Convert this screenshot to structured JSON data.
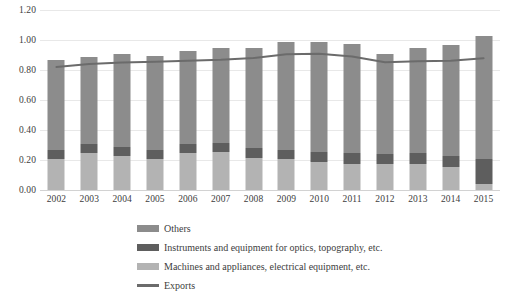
{
  "chart_data": {
    "type": "bar",
    "subtype": "stacked-bar-with-line",
    "title": "",
    "xlabel": "",
    "ylabel": "",
    "ylim": [
      0.0,
      1.2
    ],
    "ytick_labels": [
      "1.20",
      "1.00",
      "0.80",
      "0.60",
      "0.40",
      "0.20",
      "0.00"
    ],
    "ytick_values": [
      1.2,
      1.0,
      0.8,
      0.6,
      0.4,
      0.2,
      0.0
    ],
    "grid": true,
    "legend_position": "bottom-left",
    "categories": [
      "2002",
      "2003",
      "2004",
      "2005",
      "2006",
      "2007",
      "2008",
      "2009",
      "2010",
      "2011",
      "2012",
      "2013",
      "2014",
      "2015"
    ],
    "series": [
      {
        "name": "Machines and appliances, electrical equipment, etc.",
        "type": "bar",
        "color": "#b3b3b3",
        "values": [
          0.205,
          0.245,
          0.225,
          0.205,
          0.245,
          0.255,
          0.215,
          0.205,
          0.185,
          0.175,
          0.175,
          0.175,
          0.155,
          0.04
        ]
      },
      {
        "name": "Instruments and equipment for optics, topography, etc.",
        "type": "bar",
        "color": "#5e5e5e",
        "values": [
          0.065,
          0.06,
          0.06,
          0.06,
          0.06,
          0.06,
          0.065,
          0.065,
          0.07,
          0.07,
          0.065,
          0.07,
          0.075,
          0.165
        ]
      },
      {
        "name": "Others",
        "type": "bar",
        "color": "#8c8c8c",
        "values": [
          0.6,
          0.585,
          0.62,
          0.63,
          0.62,
          0.63,
          0.665,
          0.715,
          0.73,
          0.73,
          0.665,
          0.7,
          0.74,
          0.825
        ]
      },
      {
        "name": "Exports",
        "type": "line",
        "color": "#6b6b6b",
        "values": [
          0.82,
          0.84,
          0.85,
          0.855,
          0.862,
          0.868,
          0.88,
          0.905,
          0.908,
          0.89,
          0.852,
          0.858,
          0.862,
          0.878
        ]
      }
    ],
    "bar_totals": [
      0.87,
      0.89,
      0.905,
      0.895,
      0.925,
      0.945,
      0.945,
      0.985,
      0.985,
      0.975,
      0.905,
      0.945,
      0.97,
      1.03
    ]
  },
  "legend": {
    "items": [
      {
        "label": "Others",
        "marker": "square-swatch",
        "color": "#8c8c8c"
      },
      {
        "label": "Instruments and equipment for optics, topography, etc.",
        "marker": "square-swatch",
        "color": "#5e5e5e"
      },
      {
        "label": "Machines and appliances, electrical equipment, etc.",
        "marker": "square-swatch",
        "color": "#b3b3b3"
      },
      {
        "label": "Exports",
        "marker": "line-swatch",
        "color": "#6b6b6b"
      }
    ]
  },
  "colors": {
    "gridline": "#e8e8e8",
    "baseline": "#d2d2d2",
    "text": "#3d3d3d",
    "background": "#ffffff"
  }
}
